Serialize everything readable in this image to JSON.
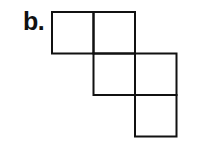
{
  "label": "b.",
  "figure": {
    "cell_size": 41.5,
    "origin": [
      52,
      12
    ],
    "stroke_color": "#111111",
    "stroke_width": 2,
    "cells": [
      {
        "col": 0,
        "row": 0
      },
      {
        "col": 1,
        "row": 0
      },
      {
        "col": 1,
        "row": 1
      },
      {
        "col": 2,
        "row": 1
      },
      {
        "col": 2,
        "row": 2
      }
    ]
  }
}
